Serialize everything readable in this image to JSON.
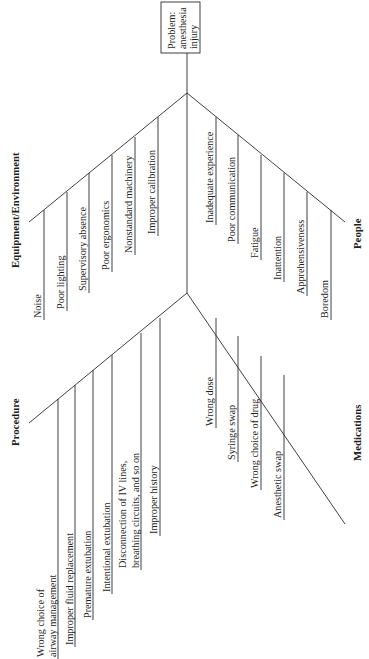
{
  "diagram": {
    "type": "fishbone",
    "orientation": "rotated-90-ccw",
    "problem": {
      "lines": [
        "Problem:",
        "anesthesia",
        "injury"
      ]
    },
    "categories": {
      "equipment": {
        "label": "Equipment/Environment",
        "causes": [
          "Noise",
          "Poor lighting",
          "Supervisory absence",
          "Poor ergonomics",
          "Nonstandard machinery",
          "Improper calibration"
        ]
      },
      "people": {
        "label": "People",
        "causes": [
          "Inadequate experience",
          "Poor communication",
          "Fatigue",
          "Inattention",
          "Apprehensiveness",
          "Boredom"
        ]
      },
      "procedure": {
        "label": "Procedure",
        "causes": [
          {
            "lines": [
              "Wrong choice of",
              "airway management"
            ]
          },
          {
            "lines": [
              "Improper fluid replacement"
            ]
          },
          {
            "lines": [
              "Premature extubation"
            ]
          },
          {
            "lines": [
              "Intentional extubation"
            ]
          },
          {
            "lines": [
              "Disconnection of IV lines,",
              "breathing circuits, and so on"
            ]
          },
          {
            "lines": [
              "Improper history"
            ]
          }
        ]
      },
      "medications": {
        "label": "Medications",
        "causes": [
          "Wrong dose",
          "Syringe swap",
          "Wrong choice of drug",
          "Anesthetic swap"
        ]
      }
    },
    "colors": {
      "line": "#2a2a2a",
      "text": "#1e1e1e",
      "background": "#ffffff"
    }
  }
}
